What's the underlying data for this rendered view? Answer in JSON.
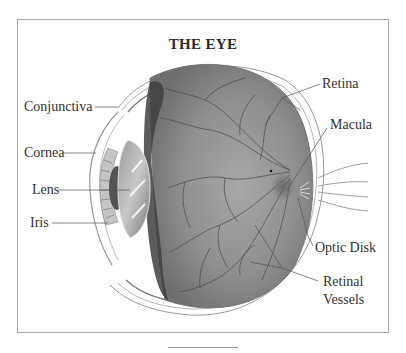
{
  "diagram": {
    "title": "THE EYE",
    "labels": {
      "conjunctiva": "Conjunctiva",
      "cornea": "Cornea",
      "lens": "Lens",
      "iris": "Iris",
      "retina": "Retina",
      "macula": "Macula",
      "optic_disk": "Optic Disk",
      "retinal_vessels_line1": "Retinal",
      "retinal_vessels_line2": "Vessels"
    }
  }
}
